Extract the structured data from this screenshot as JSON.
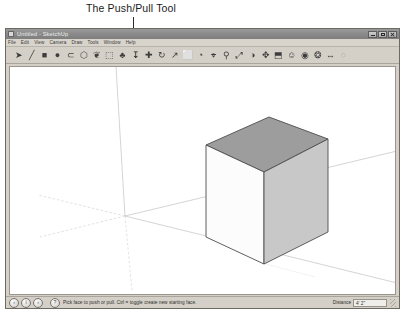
{
  "annotation": {
    "label": "The Push/Pull Tool",
    "leader_name": "leader-line"
  },
  "window": {
    "title": "Untitled - SketchUp",
    "icon": "sketchup-app-icon",
    "controls": [
      {
        "name": "minimize-button",
        "glyph": "_"
      },
      {
        "name": "maximize-button",
        "glyph": "□"
      },
      {
        "name": "close-button",
        "glyph": "×"
      }
    ]
  },
  "menu": {
    "items": [
      {
        "label": "File"
      },
      {
        "label": "Edit"
      },
      {
        "label": "View"
      },
      {
        "label": "Camera"
      },
      {
        "label": "Draw"
      },
      {
        "label": "Tools"
      },
      {
        "label": "Window"
      },
      {
        "label": "Help"
      }
    ]
  },
  "toolbar": {
    "tools": [
      {
        "name": "select-tool",
        "glyph": "➤",
        "state": "normal"
      },
      {
        "name": "line-tool",
        "glyph": "╱",
        "state": "normal"
      },
      {
        "name": "rectangle-tool",
        "glyph": "■",
        "state": "normal"
      },
      {
        "name": "circle-tool",
        "glyph": "●",
        "state": "normal"
      },
      {
        "name": "arc-tool",
        "glyph": "⊂",
        "state": "normal"
      },
      {
        "name": "polygon-tool",
        "glyph": "⬡",
        "state": "normal"
      },
      {
        "name": "freehand-tool",
        "glyph": "❦",
        "state": "normal"
      },
      {
        "name": "eraser-tool",
        "glyph": "⬚",
        "state": "normal"
      },
      {
        "name": "paint-bucket-tool",
        "glyph": "♣",
        "state": "normal"
      },
      {
        "name": "push-pull-tool",
        "glyph": "↧",
        "state": "active"
      },
      {
        "name": "move-tool",
        "glyph": "✚",
        "state": "normal"
      },
      {
        "name": "rotate-tool",
        "glyph": "↻",
        "state": "normal"
      },
      {
        "name": "follow-me-tool",
        "glyph": "↗",
        "state": "normal"
      },
      {
        "name": "scale-tool",
        "glyph": "⬜",
        "state": "normal"
      },
      {
        "name": "offset-tool",
        "glyph": "◔",
        "state": "normal"
      },
      {
        "name": "tape-measure-tool",
        "glyph": "⌖",
        "state": "normal"
      },
      {
        "name": "zoom-tool",
        "glyph": "⚲",
        "state": "normal"
      },
      {
        "name": "zoom-extents-tool",
        "glyph": "⤢",
        "state": "normal"
      },
      {
        "name": "orbit-tool",
        "glyph": "◑",
        "state": "normal"
      },
      {
        "name": "pan-tool",
        "glyph": "✥",
        "state": "normal"
      },
      {
        "name": "section-plane-tool",
        "glyph": "⬒",
        "state": "normal"
      },
      {
        "name": "walk-tool",
        "glyph": "☺",
        "state": "normal"
      },
      {
        "name": "look-around-tool",
        "glyph": "◉",
        "state": "normal"
      },
      {
        "name": "position-camera-tool",
        "glyph": "❂",
        "state": "normal"
      },
      {
        "name": "dimension-tool",
        "glyph": "↔",
        "state": "normal"
      },
      {
        "name": "text-tool",
        "glyph": "○",
        "state": "faded"
      }
    ]
  },
  "drawing": {
    "model_name": "cube-model",
    "axes": {
      "red_axis": "red-axis-line",
      "green_axis": "green-axis-line",
      "blue_axis": "blue-axis-line",
      "origin_x": 120,
      "origin_y": 212
    },
    "cube": {
      "top_face_color": "#9e9e9e",
      "left_face_color": "#fbfbfb",
      "right_face_color": "#c9c9c9",
      "edge_color": "#4a4a4a"
    },
    "background_color": "#ffffff"
  },
  "status": {
    "icons": [
      {
        "name": "back-arrow-icon",
        "glyph": "‹"
      },
      {
        "name": "info-icon",
        "glyph": "i"
      },
      {
        "name": "forward-arrow-icon",
        "glyph": "›"
      }
    ],
    "help_icon": {
      "name": "question-mark-icon",
      "glyph": "?"
    },
    "message": "Pick face to push or pull. Ctrl = toggle create new starting face.",
    "measurement_label": "Distance",
    "measurement_value": "4' 2\""
  }
}
